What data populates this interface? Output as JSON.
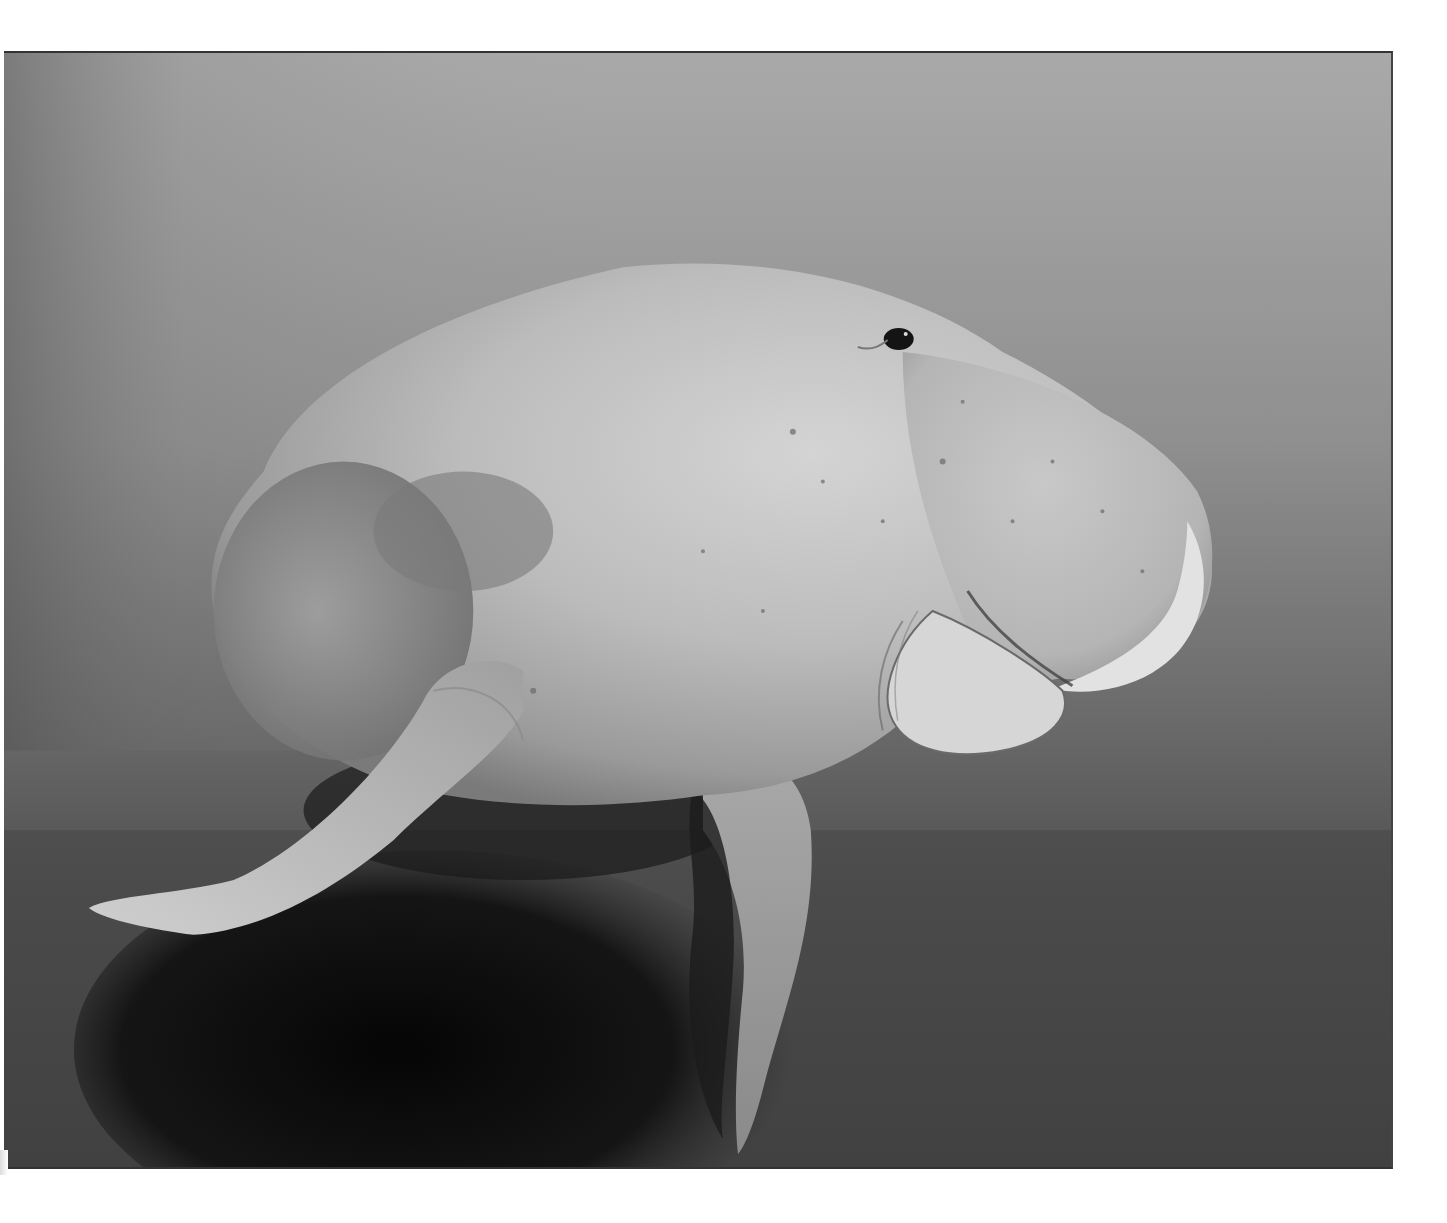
{
  "page": {
    "type": "scanned-book-page",
    "background": "#ffffff"
  },
  "photo": {
    "subject": "dugong swimming underwater above seagrass seabed",
    "tone": "black-and-white",
    "colors": {
      "water_light": "#b0b0b0",
      "water_mid": "#8e8e8e",
      "water_dark": "#5a5a5a",
      "seabed": "#4a4a4a",
      "shadow": "#0c0c0c",
      "body_light": "#d2d2d2",
      "body_mid": "#b4b4b4",
      "body_shadow": "#6e6e6e",
      "snout_highlight": "#e4e4e4",
      "eye": "#141414",
      "frame_border": "#333333"
    }
  },
  "caption": {
    "text": "",
    "note": "caption text clipped at bottom edge of screenshot; only ascender tops visible"
  }
}
